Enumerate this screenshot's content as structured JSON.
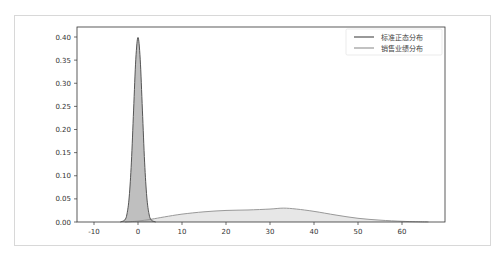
{
  "chart_data": {
    "type": "area",
    "title": "",
    "xlabel": "",
    "ylabel": "",
    "xlim": [
      -12,
      68
    ],
    "ylim": [
      0,
      0.42
    ],
    "x_ticks": [
      -10,
      0,
      10,
      20,
      30,
      40,
      50,
      60
    ],
    "x_tick_labels": [
      "-10",
      "0",
      "10",
      "20",
      "30",
      "40",
      "50",
      "60"
    ],
    "y_ticks": [
      0.0,
      0.05,
      0.1,
      0.15,
      0.2,
      0.25,
      0.3,
      0.35,
      0.4
    ],
    "y_tick_labels": [
      "0.00",
      "0.05",
      "0.10",
      "0.15",
      "0.20",
      "0.25",
      "0.30",
      "0.35",
      "0.40"
    ],
    "grid": false,
    "legend_position": "upper right",
    "series": [
      {
        "name": "标准正态分布",
        "kind": "kde",
        "line_color": "#555555",
        "fill_color": "#aaaaaa",
        "x": [
          -4,
          -3,
          -2.5,
          -2,
          -1.5,
          -1,
          -0.5,
          0,
          0.5,
          1,
          1.5,
          2,
          2.5,
          3,
          4
        ],
        "values": [
          0.0001,
          0.0044,
          0.0175,
          0.054,
          0.1295,
          0.242,
          0.352,
          0.399,
          0.352,
          0.242,
          0.1295,
          0.054,
          0.0175,
          0.0044,
          0.0001
        ]
      },
      {
        "name": "销售业绩分布",
        "kind": "kde",
        "line_color": "#999999",
        "fill_color": "#dddddd",
        "x": [
          -3,
          0,
          3,
          6,
          10,
          15,
          20,
          25,
          30,
          33,
          36,
          40,
          45,
          50,
          55,
          60,
          63,
          66
        ],
        "values": [
          0.0,
          0.002,
          0.006,
          0.011,
          0.017,
          0.022,
          0.025,
          0.026,
          0.028,
          0.03,
          0.028,
          0.023,
          0.015,
          0.008,
          0.004,
          0.0015,
          0.0007,
          0.0002
        ]
      }
    ]
  },
  "legend": {
    "items": [
      {
        "label": "标准正态分布",
        "color": "#555555"
      },
      {
        "label": "销售业绩分布",
        "color": "#999999"
      }
    ]
  }
}
